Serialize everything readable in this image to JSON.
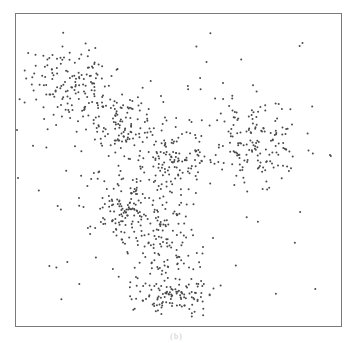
{
  "chart_data": {
    "type": "scatter",
    "title": "",
    "xlabel": "",
    "ylabel": "",
    "grid": false,
    "legend": null,
    "axes_ticks": false,
    "point_color": "#4a4a4a",
    "point_size": 1.6,
    "frame": {
      "left": 15,
      "top": 13,
      "right": 342,
      "bottom": 327
    },
    "clusters": [
      {
        "name": "upper-left arm",
        "cx": 70,
        "cy": 80,
        "sx": 22,
        "sy": 18,
        "n": 130
      },
      {
        "name": "upper-left to center bridge",
        "cx": 120,
        "cy": 125,
        "sx": 25,
        "sy": 18,
        "n": 140
      },
      {
        "name": "center",
        "cx": 175,
        "cy": 160,
        "sx": 22,
        "sy": 15,
        "n": 120
      },
      {
        "name": "right arm",
        "cx": 255,
        "cy": 140,
        "sx": 24,
        "sy": 20,
        "n": 160
      },
      {
        "name": "center-left lobe",
        "cx": 125,
        "cy": 205,
        "sx": 22,
        "sy": 20,
        "n": 140
      },
      {
        "name": "lower stem",
        "cx": 160,
        "cy": 245,
        "sx": 18,
        "sy": 22,
        "n": 120
      },
      {
        "name": "bottom cluster",
        "cx": 175,
        "cy": 295,
        "sx": 20,
        "sy": 10,
        "n": 110
      },
      {
        "name": "background noise",
        "uniform": true,
        "n": 60
      }
    ],
    "outliers": [
      [
        17,
        130
      ],
      [
        18,
        178
      ],
      [
        330,
        155
      ],
      [
        213,
        238
      ]
    ]
  },
  "caption": "(b)"
}
